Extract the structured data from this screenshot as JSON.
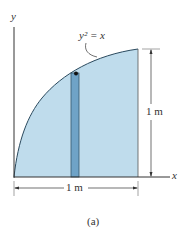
{
  "figure": {
    "equation": "y² = x",
    "axis_x_label": "x",
    "axis_y_label": "y",
    "width_dimension": "1 m",
    "height_dimension": "1 m",
    "caption": "(a)"
  },
  "colors": {
    "region_fill": "#bfdcec",
    "strip_fill": "#6fa3c7",
    "lines": "#333333"
  }
}
